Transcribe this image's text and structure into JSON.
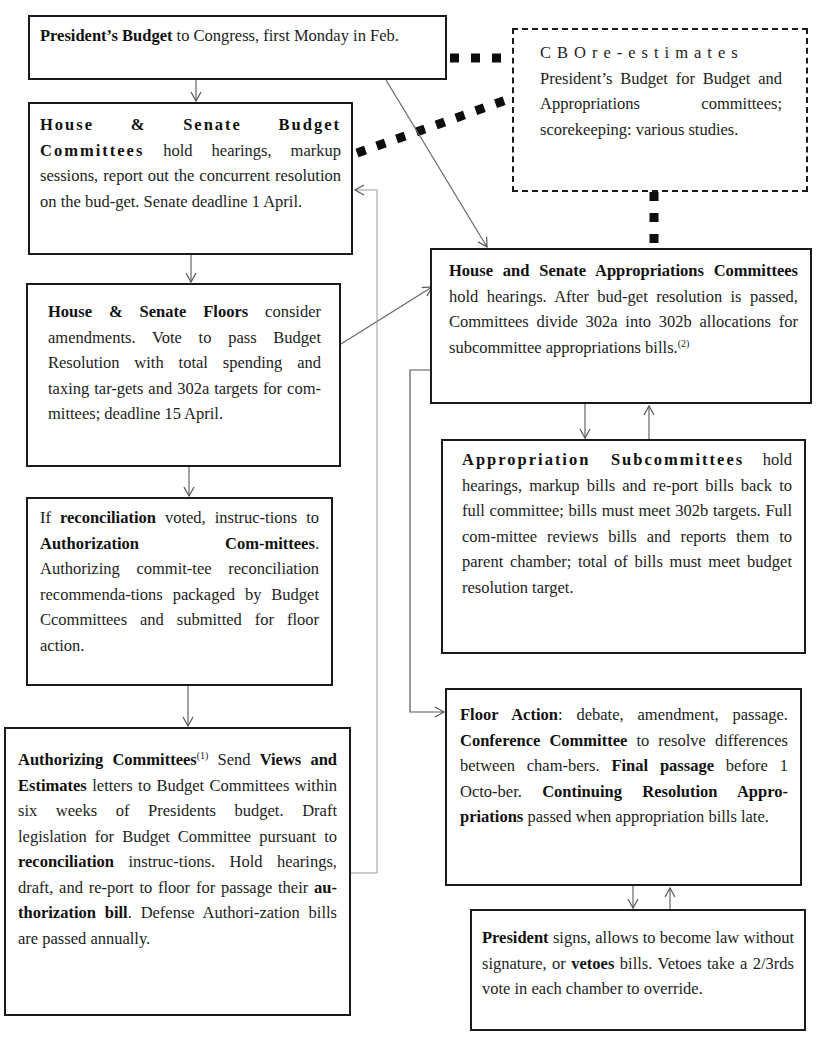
{
  "diagram": {
    "type": "flowchart",
    "nodes": [
      {
        "id": "presidents_budget",
        "segments": [
          {
            "text": "President’s Budget",
            "bold": true
          },
          {
            "text": " to Congress,  first Monday in Feb.",
            "bold": false
          }
        ]
      },
      {
        "id": "cbo",
        "style": "dashed",
        "segments": [
          {
            "text": "CBOre-estimates",
            "bold": false,
            "spaced": true
          },
          {
            "text": " President’s Budget  for Budget and Appropriations committees; scorekeeping: various studies.",
            "bold": false
          }
        ]
      },
      {
        "id": "budget_committees",
        "segments": [
          {
            "text": "House & Senate Budget Committees",
            "bold": true
          },
          {
            "text": " hold hearings, markup sessions, report out the concurrent resolution on the bud-get. Senate deadline 1 April.",
            "bold": false
          }
        ]
      },
      {
        "id": "floors",
        "segments": [
          {
            "text": "House & Senate Floors",
            "bold": true
          },
          {
            "text": " consider amendments. Vote to pass Budget Resolution with total spending and taxing tar-gets and 302a targets  for com-mittees; deadline 15 April.",
            "bold": false
          }
        ]
      },
      {
        "id": "reconciliation",
        "segments": [
          {
            "text": "If ",
            "bold": false
          },
          {
            "text": "reconciliation",
            "bold": true
          },
          {
            "text": " voted, instruc-tions to ",
            "bold": false
          },
          {
            "text": "Authorization Com-mittees",
            "bold": true
          },
          {
            "text": ". Authorizing commit-tee reconciliation recommenda-tions packaged by Budget Ccommittees and submitted for floor action.",
            "bold": false
          }
        ]
      },
      {
        "id": "authorizing_committees",
        "segments": [
          {
            "text": "Authorizing Committees",
            "bold": true
          },
          {
            "text": "(1)",
            "bold": false,
            "sup": true
          },
          {
            "text": " Send ",
            "bold": false
          },
          {
            "text": "Views and Estimates",
            "bold": true
          },
          {
            "text": " letters to Budget Committees within six weeks of Presidents budget. Draft legislation for Budget Committee pursuant to ",
            "bold": false
          },
          {
            "text": "reconciliation",
            "bold": true
          },
          {
            "text": " instruc-tions. Hold  hearings, draft, and re-port to floor for passage their ",
            "bold": false
          },
          {
            "text": "au-thorization bill",
            "bold": true
          },
          {
            "text": ". Defense Authori-zation bills are passed annually.",
            "bold": false
          }
        ]
      },
      {
        "id": "appropriations_committees",
        "segments": [
          {
            "text": "House and Senate Appropriations Committees",
            "bold": true
          },
          {
            "text": " hold  hearings. After bud-get resolution is passed, Committees divide 302a into 302b allocations for subcommittee appropriations bills.",
            "bold": false
          },
          {
            "text": "(2)",
            "bold": false,
            "sup": true
          }
        ]
      },
      {
        "id": "subcommittees",
        "segments": [
          {
            "text": "Appropriation Subcommittees",
            "bold": true,
            "spaced": true
          },
          {
            "text": " hold hearings, markup bills and re-port bills back to full committee; bills must meet 302b targets. Full com-mittee reviews bills and reports them to parent chamber; total of bills must meet budget resolution target.",
            "bold": false
          }
        ]
      },
      {
        "id": "floor_action",
        "segments": [
          {
            "text": "Floor Action",
            "bold": true
          },
          {
            "text": ": debate, amendment, passage. ",
            "bold": false
          },
          {
            "text": "Conference Committee",
            "bold": true
          },
          {
            "text": " to resolve differences between cham-bers. ",
            "bold": false
          },
          {
            "text": "Final passage",
            "bold": true
          },
          {
            "text": " before 1 Octo-ber. ",
            "bold": false
          },
          {
            "text": "Continuing Resolution Appro-priations",
            "bold": true
          },
          {
            "text": " passed  when appropriation bills  late.",
            "bold": false
          }
        ]
      },
      {
        "id": "president_signs",
        "segments": [
          {
            "text": "President",
            "bold": true
          },
          {
            "text": " signs, allows to become law without signature,  or ",
            "bold": false
          },
          {
            "text": "vetoes",
            "bold": true
          },
          {
            "text": " bills. Vetoes take a  2/3rds vote in each chamber to override.",
            "bold": false
          }
        ]
      }
    ],
    "edges": [
      {
        "from": "presidents_budget",
        "to": "budget_committees",
        "style": "arrow"
      },
      {
        "from": "presidents_budget",
        "to": "appropriations_committees",
        "style": "arrow"
      },
      {
        "from": "presidents_budget",
        "to": "cbo",
        "style": "heavy-dotted"
      },
      {
        "from": "budget_committees",
        "to": "cbo",
        "style": "heavy-dotted"
      },
      {
        "from": "cbo",
        "to": "appropriations_committees",
        "style": "heavy-dotted"
      },
      {
        "from": "budget_committees",
        "to": "floors",
        "style": "arrow"
      },
      {
        "from": "floors",
        "to": "appropriations_committees",
        "style": "arrow"
      },
      {
        "from": "floors",
        "to": "reconciliation",
        "style": "arrow"
      },
      {
        "from": "reconciliation",
        "to": "authorizing_committees",
        "style": "arrow"
      },
      {
        "from": "authorizing_committees",
        "to": "budget_committees",
        "style": "thin-elbow-arrow"
      },
      {
        "from": "appropriations_committees",
        "to": "subcommittees",
        "style": "arrow"
      },
      {
        "from": "subcommittees",
        "to": "appropriations_committees",
        "style": "arrow"
      },
      {
        "from": "appropriations_committees",
        "to": "floor_action",
        "style": "elbow-arrow"
      },
      {
        "from": "floor_action",
        "to": "president_signs",
        "style": "arrow"
      },
      {
        "from": "president_signs",
        "to": "floor_action",
        "style": "arrow"
      }
    ]
  }
}
